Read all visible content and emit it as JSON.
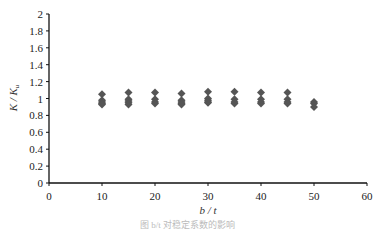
{
  "chart_data": {
    "type": "scatter",
    "title": "",
    "xlabel": "b / t",
    "ylabel": "K / K_u",
    "xlim": [
      0,
      60
    ],
    "ylim": [
      0,
      2
    ],
    "x_ticks": [
      0,
      10,
      20,
      30,
      40,
      50,
      60
    ],
    "y_ticks": [
      0,
      0.2,
      0.4,
      0.6,
      0.8,
      1,
      1.2,
      1.4,
      1.6,
      1.8,
      2
    ],
    "y_tick_labels": [
      "0",
      "0.2",
      "0.4",
      "0.6",
      "0.8",
      "1",
      "1.2",
      "1.4",
      "1.6",
      "1.8",
      "2"
    ],
    "x_tick_labels": [
      "0",
      "10",
      "20",
      "30",
      "40",
      "50",
      "60"
    ],
    "grid": false,
    "legend": null,
    "marker": "diamond",
    "marker_color": "#555555",
    "series": [
      {
        "name": "K/Ku",
        "points": [
          [
            10,
            1.05
          ],
          [
            10,
            0.98
          ],
          [
            10,
            0.96
          ],
          [
            10,
            0.94
          ],
          [
            10,
            0.93
          ],
          [
            15,
            1.07
          ],
          [
            15,
            0.99
          ],
          [
            15,
            0.97
          ],
          [
            15,
            0.95
          ],
          [
            15,
            0.93
          ],
          [
            20,
            1.07
          ],
          [
            20,
            0.99
          ],
          [
            20,
            0.96
          ],
          [
            20,
            0.94
          ],
          [
            25,
            1.06
          ],
          [
            25,
            0.98
          ],
          [
            25,
            0.96
          ],
          [
            25,
            0.94
          ],
          [
            25,
            0.93
          ],
          [
            30,
            1.08
          ],
          [
            30,
            1.0
          ],
          [
            30,
            0.98
          ],
          [
            30,
            0.96
          ],
          [
            30,
            0.95
          ],
          [
            35,
            1.08
          ],
          [
            35,
            0.99
          ],
          [
            35,
            0.96
          ],
          [
            35,
            0.94
          ],
          [
            40,
            1.07
          ],
          [
            40,
            0.99
          ],
          [
            40,
            0.96
          ],
          [
            40,
            0.94
          ],
          [
            45,
            1.07
          ],
          [
            45,
            0.99
          ],
          [
            45,
            0.96
          ],
          [
            45,
            0.94
          ],
          [
            50,
            0.96
          ],
          [
            50,
            0.94
          ],
          [
            50,
            0.9
          ]
        ]
      }
    ]
  },
  "caption": "图 b/t 对稳定系数的影响"
}
